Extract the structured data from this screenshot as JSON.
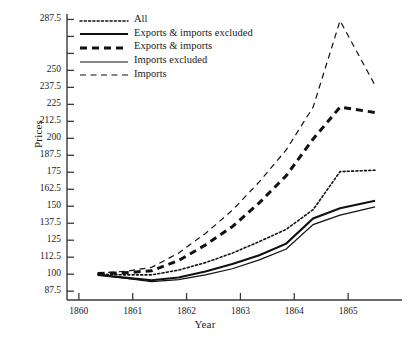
{
  "chart_data": {
    "type": "line",
    "title": "",
    "xlabel": "Year",
    "ylabel": "Prices",
    "xlim": [
      1859.78,
      1866.0
    ],
    "ylim": [
      81.0,
      291.5
    ],
    "grid": false,
    "legend_position": "top-left",
    "xticks": [
      1860,
      1861,
      1862,
      1863,
      1864,
      1865
    ],
    "xticklabels": [
      "1860",
      "1861",
      "1862",
      "1863",
      "1864",
      "1865"
    ],
    "yticks": [
      87.5,
      100,
      112.5,
      125,
      137.5,
      150,
      162.5,
      175,
      187.5,
      200,
      212.5,
      225,
      237.5,
      250,
      262.5,
      275,
      287.5
    ],
    "yticklabels": [
      "87.5",
      "100",
      "112.5",
      "125",
      "137.5",
      "150",
      "162.5",
      "175",
      "187.5",
      "200",
      "212.5",
      "225",
      "237.5",
      "250",
      "",
      "",
      "287.5"
    ],
    "x": [
      1860.35,
      1860.85,
      1861.35,
      1861.85,
      1862.35,
      1862.85,
      1863.35,
      1863.85,
      1864.35,
      1864.85,
      1865.5
    ],
    "series": [
      {
        "name": "All",
        "style": "dotted",
        "width": 1.6,
        "values": [
          100,
          99.5,
          99.5,
          103,
          108.5,
          115.5,
          124,
          133,
          147.5,
          175.5,
          176.5
        ]
      },
      {
        "name": "Exports & imports excluded",
        "style": "solid",
        "width": 2.1,
        "values": [
          99.5,
          97.5,
          95.5,
          97.5,
          102,
          107.5,
          114,
          122.5,
          141,
          148.5,
          154
        ]
      },
      {
        "name": "Exports & imports",
        "style": "dashed-thick",
        "width": 3.0,
        "values": [
          100.5,
          101,
          102.5,
          110,
          121.5,
          135,
          152.5,
          172.5,
          199.5,
          223,
          219
        ]
      },
      {
        "name": "Imports excluded",
        "style": "solid",
        "width": 1.2,
        "values": [
          99.5,
          97,
          94.5,
          96,
          99.5,
          104,
          110.5,
          118.5,
          136.5,
          143.5,
          149.5
        ]
      },
      {
        "name": "Imports",
        "style": "dashed-thin",
        "width": 1.2,
        "values": [
          101,
          102,
          105,
          115.5,
          130,
          147,
          168,
          191.5,
          223,
          286.5,
          239
        ]
      }
    ]
  },
  "axes": {
    "ylabel": "Prices",
    "xlabel": "Year"
  },
  "legend": {
    "items": [
      {
        "label": "All"
      },
      {
        "label": "Exports & imports excluded"
      },
      {
        "label": "Exports & imports"
      },
      {
        "label": "Imports excluded"
      },
      {
        "label": "Imports"
      }
    ]
  }
}
